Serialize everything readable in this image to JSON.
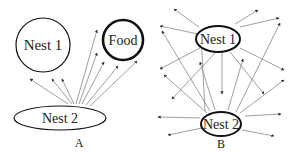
{
  "panels": [
    {
      "id": "A",
      "label": "A",
      "nodes": [
        {
          "name": "Nest 1",
          "shape": "circle"
        },
        {
          "name": "Food",
          "shape": "circle-bold"
        },
        {
          "name": "Nest 2",
          "shape": "ellipse"
        }
      ],
      "arrow_source": "Nest 2",
      "arrow_count": 8
    },
    {
      "id": "B",
      "label": "B",
      "nodes": [
        {
          "name": "Nest 1",
          "shape": "ellipse-bold"
        },
        {
          "name": "Nest 2",
          "shape": "ellipse-bold"
        }
      ],
      "arrow_sources": [
        "Nest 1",
        "Nest 2"
      ],
      "arrow_count": 22
    }
  ],
  "colors": {
    "line": "#888888",
    "stroke": "#111111",
    "text": "#222222"
  }
}
